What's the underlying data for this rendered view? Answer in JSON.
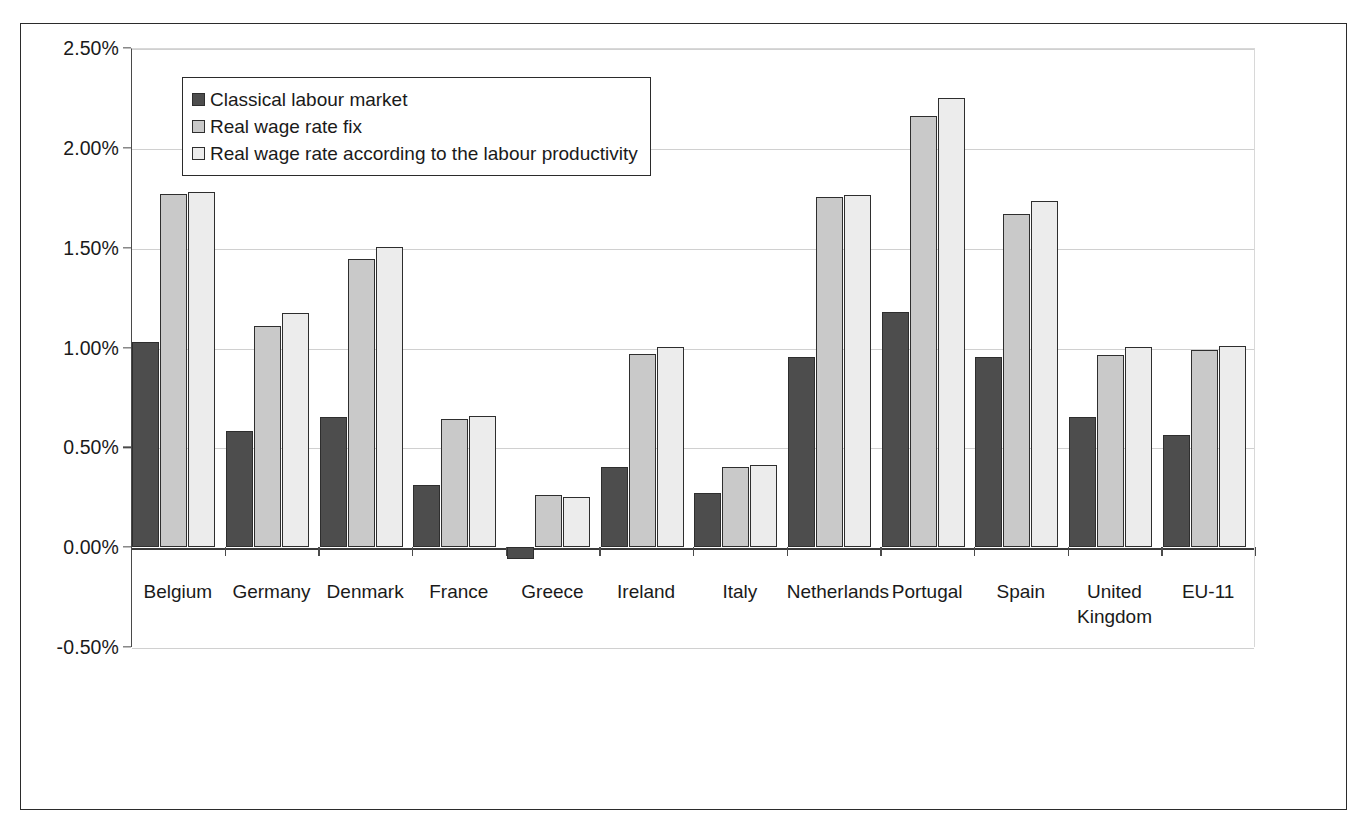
{
  "chart_data": {
    "type": "bar",
    "title": "",
    "subtitle": "",
    "xlabel": "",
    "ylabel": "",
    "ylim": [
      -0.5,
      2.5
    ],
    "ytick_values": [
      2.5,
      2.0,
      1.5,
      1.0,
      0.5,
      0.0,
      -0.5
    ],
    "ytick_labels": [
      "2.50%",
      "2.00%",
      "1.50%",
      "1.00%",
      "0.50%",
      "0.00%",
      "-0.50%"
    ],
    "grid": true,
    "legend_position": "top-left",
    "value_unit": "%",
    "categories": [
      "Belgium",
      "Germany",
      "Denmark",
      "France",
      "Greece",
      "Ireland",
      "Italy",
      "Netherlands",
      "Portugal",
      "Spain",
      "United\nKingdom",
      "EU-11"
    ],
    "series": [
      {
        "name": "Classical labour market",
        "color": "#4d4d4d",
        "values": [
          1.03,
          0.58,
          0.65,
          0.31,
          -0.06,
          0.4,
          0.27,
          0.95,
          1.18,
          0.95,
          0.65,
          0.56
        ]
      },
      {
        "name": "Real wage rate fix",
        "color": "#c9c9c9",
        "values": [
          1.77,
          1.11,
          1.445,
          0.64,
          0.26,
          0.965,
          0.4,
          1.755,
          2.16,
          1.67,
          0.96,
          0.985
        ]
      },
      {
        "name": "Real wage rate according to the labour productivity",
        "color": "#ececec",
        "values": [
          1.78,
          1.175,
          1.505,
          0.655,
          0.25,
          1.005,
          0.41,
          1.765,
          2.25,
          1.735,
          1.005,
          1.01
        ]
      }
    ]
  }
}
